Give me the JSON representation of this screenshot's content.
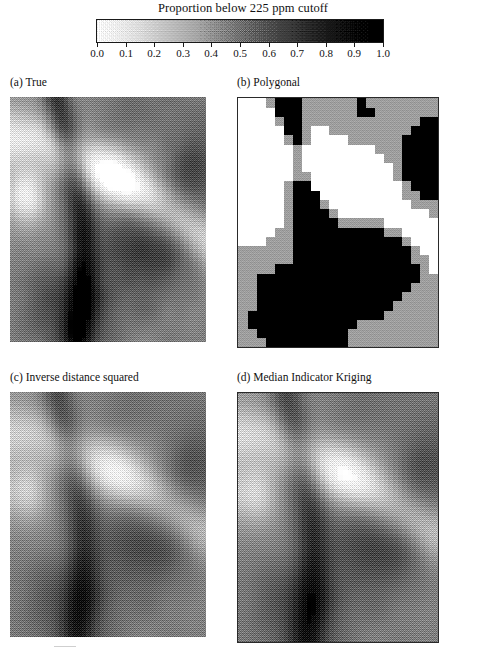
{
  "figure": {
    "domain": "scientific-figure",
    "background": "#ffffff",
    "ink_color": "#111111"
  },
  "colorbar": {
    "title": "Proportion below 225 ppm cutoff",
    "min": 0.0,
    "max": 1.0,
    "low_color": "#ffffff",
    "high_color": "#000000",
    "orientation": "horizontal",
    "dithered": true,
    "tick_values": [
      0.0,
      0.1,
      0.2,
      0.3,
      0.4,
      0.5,
      0.6,
      0.7,
      0.8,
      0.9,
      1.0
    ],
    "tick_labels": [
      "0.0",
      "0.1",
      "0.2",
      "0.3",
      "0.4",
      "0.5",
      "0.6",
      "0.7",
      "0.8",
      "0.9",
      "1.0"
    ]
  },
  "panels": [
    {
      "id": "a",
      "label": "(a)  True",
      "name": "true",
      "width": 196,
      "height": 245,
      "cols": 44,
      "rows": 55,
      "style": "pixelated",
      "smoothing": 0.0,
      "contrast": 1.25,
      "dither": 0.5,
      "framed": false,
      "seed": 7
    },
    {
      "id": "b",
      "label": "(b)  Polygonal",
      "name": "polygonal",
      "width": 200,
      "height": 249,
      "cols": 22,
      "rows": 27,
      "style": "blocky",
      "smoothing": 0.0,
      "contrast": 2.6,
      "dither": 0.25,
      "framed": true,
      "seed": 7
    },
    {
      "id": "c",
      "label": "(c)  Inverse distance squared",
      "name": "inverse-distance-squared",
      "width": 196,
      "height": 245,
      "cols": 44,
      "rows": 55,
      "style": "smooth",
      "smoothing": 1.15,
      "contrast": 0.92,
      "dither": 0.55,
      "framed": false,
      "seed": 7
    },
    {
      "id": "d",
      "label": "(d)  Median Indicator Kriging",
      "name": "median-indicator-kriging",
      "width": 200,
      "height": 249,
      "cols": 44,
      "rows": 55,
      "style": "smooth",
      "smoothing": 1.45,
      "contrast": 1.0,
      "dither": 0.55,
      "framed": true,
      "seed": 7
    }
  ],
  "chart_data": {
    "type": "heatmap",
    "title": "Proportion below 225 ppm cutoff",
    "subtitle": "",
    "xlabel": "",
    "ylabel": "",
    "colorbar": {
      "label": "Proportion below 225 ppm cutoff",
      "ticks": [
        0.0,
        0.1,
        0.2,
        0.3,
        0.4,
        0.5,
        0.6,
        0.7,
        0.8,
        0.9,
        1.0
      ],
      "vmin": 0.0,
      "vmax": 1.0,
      "cmap": "gray_reversed"
    },
    "grid": false,
    "legend_position": "top",
    "panel_titles": [
      "(a)  True",
      "(b)  Polygonal",
      "(c)  Inverse distance squared",
      "(d)  Median Indicator Kriging"
    ],
    "panel_grid_shape": [
      2,
      2
    ],
    "field_resolution": {
      "a": [
        44,
        55
      ],
      "b": [
        22,
        27
      ],
      "c": [
        44,
        55
      ],
      "d": [
        44,
        55
      ]
    },
    "spatial_features": [
      "high-value (dark) diagonal band running from upper-left toward lower-centre",
      "broad low-value (white) arc sweeping across the upper-right quadrant",
      "dark high-proportion cluster in the centre-right and lower-right of each map",
      "white low-proportion pocket at the left edge mid-height"
    ]
  }
}
